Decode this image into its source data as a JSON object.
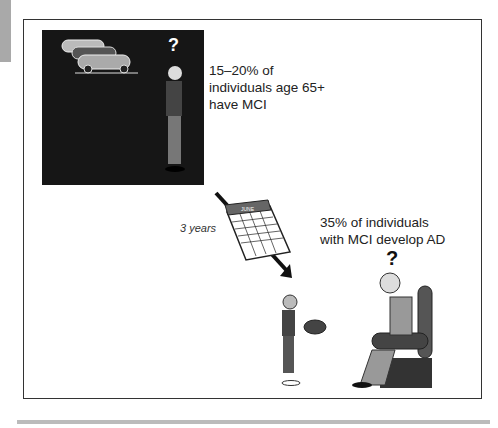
{
  "figure": {
    "panel_top": {
      "question_mark": "?",
      "statistic": [
        "15–20% of",
        "individuals age 65+",
        "have MCI"
      ]
    },
    "transition": {
      "duration_label": "3 years",
      "calendar_month": "JUNE"
    },
    "panel_bottom": {
      "question_mark": "?",
      "statistic": [
        "35% of individuals",
        "with MCI develop AD"
      ]
    }
  },
  "colors": {
    "background": "#ffffff",
    "frame": "#333333",
    "dark_panel": "#161616",
    "footer_bar": "#bbbbbb",
    "side_tab": "#a9a9a9"
  }
}
